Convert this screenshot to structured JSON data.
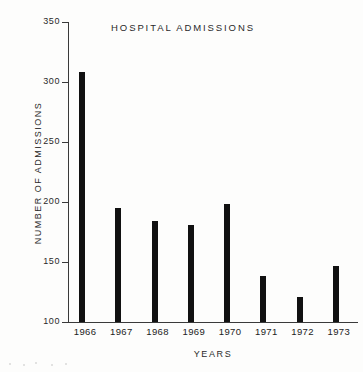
{
  "chart_data": {
    "type": "bar",
    "title": "HOSPITAL  ADMISSIONS",
    "xlabel": "YEARS",
    "ylabel": "NUMBER OF ADMISSIONS",
    "categories": [
      "1966",
      "1967",
      "1968",
      "1969",
      "1970",
      "1971",
      "1972",
      "1973"
    ],
    "values": [
      308,
      195,
      184,
      181,
      198,
      138,
      121,
      147
    ],
    "ylim": [
      100,
      350
    ],
    "yticks": [
      100,
      150,
      200,
      250,
      300,
      350
    ],
    "ytick_labels": [
      "100",
      "150",
      "200",
      "250",
      "300",
      "350"
    ],
    "grid": false,
    "legend": null,
    "bar_color": "#111111",
    "axis_color": "#3a3a3a",
    "background": "#fdfdfc"
  }
}
